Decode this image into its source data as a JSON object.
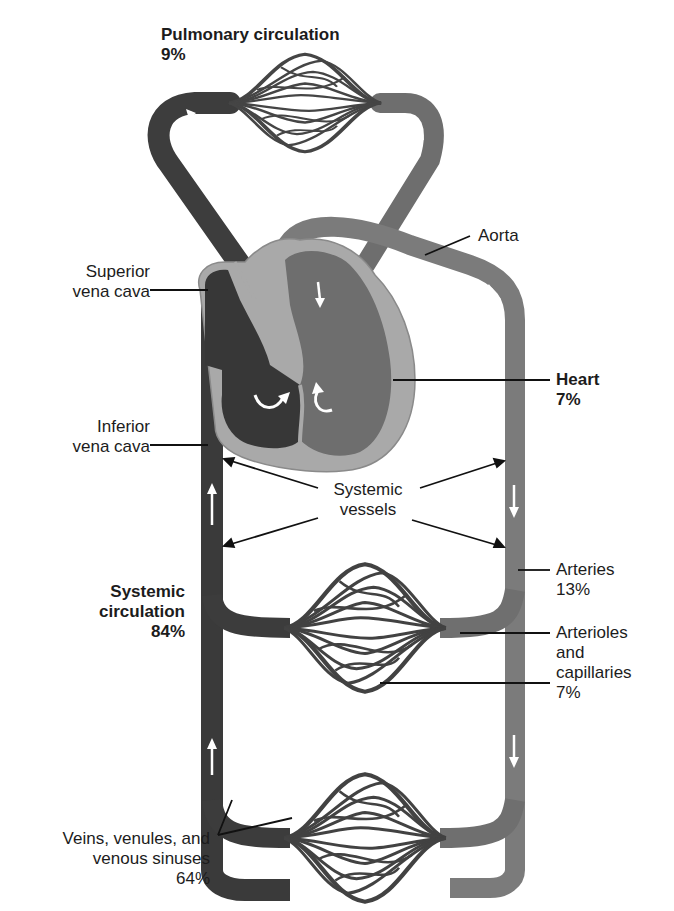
{
  "colors": {
    "deoxygenated": "#3a3a3a",
    "oxygenated": "#7a7a7a",
    "heart_wall": "#a8a8a8",
    "background": "#ffffff",
    "leader_line": "#111111",
    "flow_arrow": "#ffffff"
  },
  "labels": {
    "pulmonary": {
      "line1": "Pulmonary circulation",
      "line2": "9%"
    },
    "aorta": {
      "line1": "Aorta"
    },
    "superior_vena_cava": {
      "line1": "Superior",
      "line2": "vena cava"
    },
    "heart": {
      "line1": "Heart",
      "line2": "7%"
    },
    "inferior_vena_cava": {
      "line1": "Inferior",
      "line2": "vena cava"
    },
    "systemic_vessels": {
      "line1": "Systemic",
      "line2": "vessels"
    },
    "arteries": {
      "line1": "Arteries",
      "line2": "13%"
    },
    "systemic_circulation": {
      "line1": "Systemic",
      "line2": "circulation",
      "line3": "84%"
    },
    "arterioles_capillaries": {
      "line1": "Arterioles",
      "line2": "and",
      "line3": "capillaries",
      "line4": "7%"
    },
    "veins": {
      "line1": "Veins, venules, and",
      "line2": "venous sinuses",
      "line3": "64%"
    }
  },
  "blood_distribution": [
    {
      "component": "Pulmonary circulation",
      "percent": 9
    },
    {
      "component": "Heart",
      "percent": 7
    },
    {
      "component": "Systemic circulation",
      "percent": 84
    },
    {
      "component": "Arteries",
      "percent": 13
    },
    {
      "component": "Arterioles and capillaries",
      "percent": 7
    },
    {
      "component": "Veins, venules, and venous sinuses",
      "percent": 64
    }
  ]
}
